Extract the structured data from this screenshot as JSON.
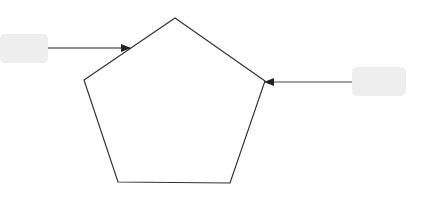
{
  "diagram": {
    "type": "pentagon-with-callouts",
    "shape": {
      "name": "pentagon",
      "stroke": "#333333",
      "fill": "#ffffff",
      "points": [
        [
          175,
          18
        ],
        [
          265,
          81
        ],
        [
          230,
          183
        ],
        [
          118,
          182
        ],
        [
          84,
          80
        ]
      ]
    },
    "callouts": [
      {
        "id": "left",
        "text": "",
        "box": {
          "x": 0,
          "y": 34,
          "w": 48,
          "h": 29,
          "fill": "#eeeeee"
        },
        "arrow": {
          "x1": 48,
          "y1": 48,
          "x2": 130,
          "y2": 48
        }
      },
      {
        "id": "right",
        "text": "",
        "box": {
          "x": 352,
          "y": 67,
          "w": 54,
          "h": 29,
          "fill": "#eeeeee"
        },
        "arrow": {
          "x1": 352,
          "y1": 82,
          "x2": 265,
          "y2": 82
        }
      }
    ]
  }
}
